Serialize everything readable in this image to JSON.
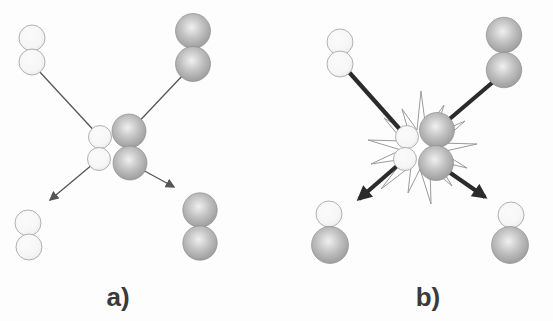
{
  "panels": [
    {
      "id": "a",
      "label": "a)",
      "molecules": [
        {
          "name": "white-diatomic-molecule",
          "position": "top-left"
        },
        {
          "name": "gray-diatomic-molecule",
          "position": "top-right"
        },
        {
          "name": "white-diatomic-molecule",
          "position": "center-collision-left"
        },
        {
          "name": "gray-diatomic-molecule",
          "position": "center-collision-right"
        },
        {
          "name": "white-diatomic-molecule",
          "position": "bottom-left"
        },
        {
          "name": "gray-diatomic-molecule",
          "position": "bottom-right"
        }
      ],
      "graphics": [
        "thin-incoming-trajectory-lines",
        "thin-outgoing-arrows"
      ]
    },
    {
      "id": "b",
      "label": "b)",
      "molecules": [
        {
          "name": "white-diatomic-molecule",
          "position": "top-left"
        },
        {
          "name": "gray-diatomic-molecule",
          "position": "top-right"
        },
        {
          "name": "white-diatomic-molecule",
          "position": "center-collision-left"
        },
        {
          "name": "gray-diatomic-molecule",
          "position": "center-collision-right"
        },
        {
          "name": "white-gray-mixed-molecule",
          "position": "bottom-left"
        },
        {
          "name": "white-gray-mixed-molecule",
          "position": "bottom-right"
        }
      ],
      "graphics": [
        "collision-starburst",
        "thick-incoming-trajectory-lines",
        "thick-outgoing-arrows"
      ]
    }
  ],
  "colors": {
    "background": "#fdfdfd",
    "white_sphere_fill": "#fbfbfb",
    "white_sphere_edge": "#a9a9a9",
    "gray_sphere_highlight": "#f0f0f0",
    "gray_sphere_mid": "#c0c0c0",
    "gray_sphere_edge": "#878787",
    "thin_line": "#565656",
    "thick_line": "#2b2b2b",
    "burst_outline": "#9a9a9a",
    "label_text": "#3a3a3a"
  }
}
